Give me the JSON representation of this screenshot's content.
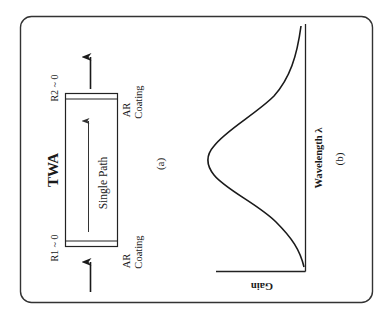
{
  "figure": {
    "panel_a": {
      "title": "TWA",
      "caption": "(a)",
      "path_label": "Single Path",
      "facet_left": {
        "reflectivity": "R1 ~ 0",
        "coating_line1": "AR",
        "coating_line2": "Coating"
      },
      "facet_right": {
        "reflectivity": "R2 ~ 0",
        "coating_line1": "AR",
        "coating_line2": "Coating"
      }
    },
    "panel_b": {
      "caption": "(b)",
      "xlabel": "Wavelength λ",
      "ylabel": "Gain"
    },
    "colors": {
      "ink": "#1a1a1a",
      "background": "#ffffff",
      "frame": "#333333"
    }
  }
}
